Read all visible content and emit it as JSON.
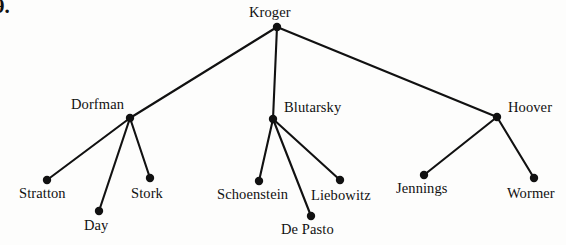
{
  "figure": {
    "kind": "tree-diagram",
    "list_marker": "9.",
    "background_color": "#fdfdfc",
    "ink_color": "#111111",
    "node_radius": 4.2,
    "edge_width": 2.1
  },
  "nodes": [
    {
      "id": "kroger",
      "label": "Kroger",
      "x": 277,
      "y": 27,
      "label_x": 249,
      "label_y": 5,
      "level": 0
    },
    {
      "id": "dorfman",
      "label": "Dorfman",
      "x": 130,
      "y": 118,
      "label_x": 71,
      "label_y": 97,
      "level": 1
    },
    {
      "id": "blutarsky",
      "label": "Blutarsky",
      "x": 273,
      "y": 119,
      "label_x": 284,
      "label_y": 100,
      "level": 1
    },
    {
      "id": "hoover",
      "label": "Hoover",
      "x": 497,
      "y": 117,
      "label_x": 508,
      "label_y": 100,
      "level": 1
    },
    {
      "id": "stratton",
      "label": "Stratton",
      "x": 47,
      "y": 180,
      "label_x": 19,
      "label_y": 186,
      "level": 2
    },
    {
      "id": "day",
      "label": "Day",
      "x": 99,
      "y": 211,
      "label_x": 84,
      "label_y": 218,
      "level": 2
    },
    {
      "id": "stork",
      "label": "Stork",
      "x": 150,
      "y": 178,
      "label_x": 131,
      "label_y": 186,
      "level": 2
    },
    {
      "id": "schoenstein",
      "label": "Schoenstein",
      "x": 259,
      "y": 181,
      "label_x": 217,
      "label_y": 187,
      "level": 2
    },
    {
      "id": "de-pasto",
      "label": "De Pasto",
      "x": 311,
      "y": 216,
      "label_x": 281,
      "label_y": 222,
      "level": 2
    },
    {
      "id": "liebowitz",
      "label": "Liebowitz",
      "x": 340,
      "y": 180,
      "label_x": 311,
      "label_y": 188,
      "level": 2
    },
    {
      "id": "jennings",
      "label": "Jennings",
      "x": 424,
      "y": 175,
      "label_x": 396,
      "label_y": 181,
      "level": 2
    },
    {
      "id": "wormer",
      "label": "Wormer",
      "x": 534,
      "y": 178,
      "label_x": 507,
      "label_y": 186,
      "level": 2
    }
  ],
  "edges": [
    {
      "from": "kroger",
      "to": "dorfman"
    },
    {
      "from": "kroger",
      "to": "blutarsky"
    },
    {
      "from": "kroger",
      "to": "hoover"
    },
    {
      "from": "dorfman",
      "to": "stratton"
    },
    {
      "from": "dorfman",
      "to": "day"
    },
    {
      "from": "dorfman",
      "to": "stork"
    },
    {
      "from": "blutarsky",
      "to": "schoenstein"
    },
    {
      "from": "blutarsky",
      "to": "de-pasto"
    },
    {
      "from": "blutarsky",
      "to": "liebowitz"
    },
    {
      "from": "hoover",
      "to": "jennings"
    },
    {
      "from": "hoover",
      "to": "wormer"
    }
  ]
}
